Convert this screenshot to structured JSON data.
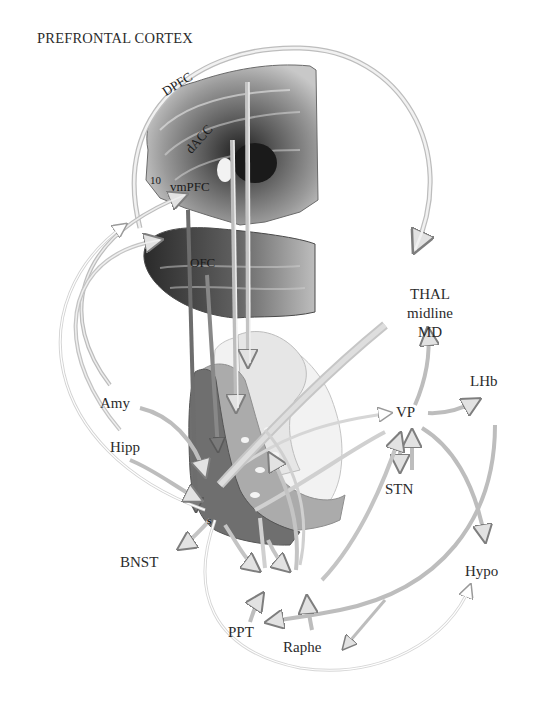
{
  "title": "PREFRONTAL CORTEX",
  "cortex_regions": {
    "dpfc": "DPFC",
    "dacc": "dACC",
    "area10": "10",
    "vmpfc": "vmPFC",
    "ofc": "OFC"
  },
  "nodes": {
    "thal_line1": "THAL",
    "thal_line2": "midline",
    "thal_line3": "MD",
    "amy": "Amy",
    "hipp": "Hipp",
    "vp": "VP",
    "lhb": "LHb",
    "stn": "STN",
    "hypo": "Hypo",
    "bnst": "BNST",
    "ppt": "PPT",
    "raphe": "Raphe",
    "striatum_s": "s"
  },
  "colors": {
    "arrow_fill": "#d9d9d9",
    "arrow_stroke": "#8a8a8a",
    "dark_arrow": "#7a7a7a",
    "striatum_dark": "#6e6e6e",
    "striatum_mid": "#a9a9a9",
    "striatum_light": "#dcdcdc",
    "brain_dark": "#3a3a3a",
    "brain_mid": "#8c8c8c"
  }
}
